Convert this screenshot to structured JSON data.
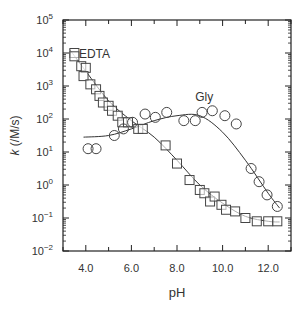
{
  "chart_data": {
    "type": "scatter",
    "title": "",
    "xlabel": "pH",
    "ylabel": "k (/M/s)",
    "xlim": [
      3,
      13
    ],
    "ylim_log10": [
      -2,
      5
    ],
    "yscale": "log",
    "grid": false,
    "x_ticks": [
      "4.0",
      "6.0",
      "8.0",
      "10.0",
      "12.0"
    ],
    "x_tick_values": [
      4,
      6,
      8,
      10,
      12
    ],
    "y_ticks": [
      "10^5",
      "10^4",
      "10^3",
      "10^2",
      "10^1",
      "10^0",
      "10^-1",
      "10^-2"
    ],
    "y_tick_exponents": [
      5,
      4,
      3,
      2,
      1,
      0,
      -1,
      -2
    ],
    "annotations": [
      {
        "text": "EDTA",
        "pH": 3.7,
        "log10k": 3.85
      },
      {
        "text": "Gly",
        "pH": 8.8,
        "log10k": 2.55
      }
    ],
    "series": [
      {
        "name": "EDTA",
        "marker": "square",
        "pH": [
          3.5,
          3.5,
          3.8,
          4.0,
          3.9,
          4.2,
          4.45,
          4.6,
          4.75,
          5.0,
          5.15,
          5.4,
          5.6,
          5.85,
          6.3,
          6.5,
          7.5,
          8.0,
          8.55,
          9.0,
          9.2,
          9.45,
          9.65,
          9.95,
          10.15,
          10.55,
          11.0,
          11.5,
          12.0,
          12.4
        ],
        "log10k": [
          4.0,
          3.9,
          3.6,
          3.55,
          3.3,
          3.05,
          2.9,
          2.7,
          2.5,
          2.4,
          2.25,
          2.1,
          1.9,
          1.9,
          1.7,
          1.7,
          1.2,
          0.65,
          0.15,
          -0.15,
          -0.25,
          -0.5,
          -0.35,
          -0.6,
          -0.75,
          -0.8,
          -1.0,
          -1.1,
          -1.1,
          -1.1
        ],
        "fit_pH": [
          3.3,
          4,
          5,
          6,
          7,
          8,
          9,
          10,
          11,
          12,
          12.5
        ],
        "fit_log10k": [
          4.1,
          3.45,
          2.55,
          1.95,
          1.45,
          0.75,
          0.0,
          -0.55,
          -0.95,
          -1.1,
          -1.12
        ]
      },
      {
        "name": "Gly",
        "marker": "circle",
        "pH": [
          4.1,
          4.45,
          5.25,
          5.65,
          6.05,
          6.6,
          7.05,
          7.55,
          8.3,
          8.8,
          9.1,
          9.55,
          10.1,
          10.6,
          11.25,
          11.6,
          11.95,
          12.4
        ],
        "log10k": [
          1.1,
          1.1,
          1.5,
          1.7,
          1.9,
          2.15,
          2.05,
          2.2,
          1.95,
          1.95,
          2.2,
          2.25,
          2.1,
          1.85,
          0.5,
          0.1,
          -0.3,
          -0.65
        ],
        "fit_pH": [
          3.9,
          5,
          6,
          7,
          8,
          9,
          10,
          11,
          12,
          12.5
        ],
        "fit_log10k": [
          1.45,
          1.5,
          1.7,
          1.95,
          2.1,
          2.1,
          1.6,
          0.75,
          -0.25,
          -0.7
        ]
      }
    ]
  }
}
